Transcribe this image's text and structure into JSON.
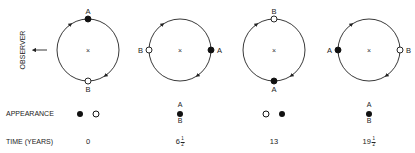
{
  "observer": {
    "label": "OBSERVER",
    "arrow": "left-arrow"
  },
  "orbits": [
    {
      "id": 1,
      "cx": 88,
      "cy": 50,
      "r": 31,
      "A": {
        "pos": "top",
        "type": "filled"
      },
      "B": {
        "pos": "bottom",
        "type": "open"
      },
      "labels": {
        "A": "A",
        "B": "B"
      }
    },
    {
      "id": 2,
      "cx": 180,
      "cy": 50,
      "r": 31,
      "A": {
        "pos": "right",
        "type": "filled"
      },
      "B": {
        "pos": "left",
        "type": "open"
      },
      "labels": {
        "A": "A",
        "B": "B"
      }
    },
    {
      "id": 3,
      "cx": 274,
      "cy": 50,
      "r": 31,
      "A": {
        "pos": "bottom",
        "type": "filled"
      },
      "B": {
        "pos": "top",
        "type": "open"
      },
      "labels": {
        "A": "A",
        "B": "B"
      }
    },
    {
      "id": 4,
      "cx": 369,
      "cy": 50,
      "r": 31,
      "A": {
        "pos": "left",
        "type": "filled"
      },
      "B": {
        "pos": "right",
        "type": "open"
      },
      "labels": {
        "A": "A",
        "B": "B"
      }
    }
  ],
  "center_mark": "×",
  "rows": {
    "appearance_label": "APPEARANCE",
    "time_label": "TIME (YEARS)"
  },
  "appearance": [
    {
      "x": 88,
      "kind": "side-by-side",
      "left": "filled",
      "right": "open"
    },
    {
      "x": 180,
      "kind": "stacked",
      "top_label": "A",
      "bottom_label": "B"
    },
    {
      "x": 274,
      "kind": "side-by-side",
      "left": "open",
      "right": "filled"
    },
    {
      "x": 369,
      "kind": "stacked",
      "top_label": "A",
      "bottom_label": "B"
    }
  ],
  "times": [
    {
      "x": 88,
      "whole": "0",
      "num": "",
      "den": ""
    },
    {
      "x": 180,
      "whole": "6",
      "num": "1",
      "den": "2"
    },
    {
      "x": 274,
      "whole": "13",
      "num": "",
      "den": ""
    },
    {
      "x": 369,
      "whole": "19",
      "num": "1",
      "den": "2"
    }
  ]
}
